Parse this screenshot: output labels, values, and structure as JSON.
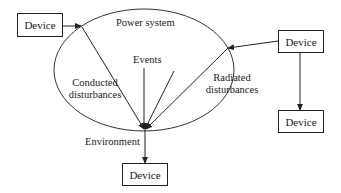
{
  "diagram": {
    "ellipse_label": "Power system",
    "events_label": "Events",
    "conducted_label_line1": "Conducted",
    "conducted_label_line2": "disturbances",
    "radiated_label_line1": "Radiated",
    "radiated_label_line2": "disturbances",
    "environment_label": "Environment",
    "devices": {
      "top_left": "Device",
      "top_right": "Device",
      "bottom_right": "Device",
      "bottom_center": "Device"
    },
    "colors": {
      "stroke": "#222222",
      "background": "#ffffff"
    }
  }
}
